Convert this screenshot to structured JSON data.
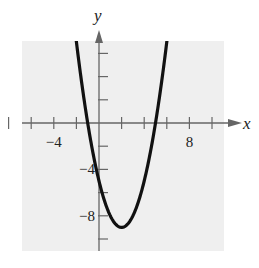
{
  "chart_data": {
    "type": "line",
    "title": "",
    "xlabel": "x",
    "ylabel": "y",
    "xlim": [
      -9,
      11
    ],
    "ylim": [
      -11,
      7
    ],
    "x_ticks": [
      -8,
      -6,
      -4,
      -2,
      2,
      4,
      6,
      8,
      10
    ],
    "y_ticks": [
      6,
      4,
      2,
      -2,
      -4,
      -6,
      -8,
      -10
    ],
    "x_tick_labels": [
      {
        "value": -4,
        "label": "−4"
      },
      {
        "value": 8,
        "label": "8"
      }
    ],
    "y_tick_labels": [
      {
        "value": -4,
        "label": "−4"
      },
      {
        "value": -8,
        "label": "−8"
      }
    ],
    "grid": false,
    "background": "#efefef",
    "series": [
      {
        "name": "y = x^2 - 4x - 5",
        "color": "#111111",
        "vertex": [
          2,
          -9
        ],
        "x_intercepts": [
          -1,
          5
        ],
        "y_intercept": -5,
        "x": [
          -2.3,
          -2,
          -1,
          0,
          1,
          2,
          3,
          4,
          5,
          6,
          6.3
        ],
        "y": [
          9.5,
          7,
          0,
          -5,
          -8,
          -9,
          -8,
          -5,
          0,
          7,
          9.5
        ]
      }
    ]
  }
}
